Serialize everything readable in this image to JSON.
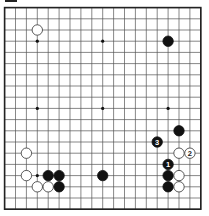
{
  "board": {
    "size": 19,
    "origin_x": 4.6,
    "origin_y": 7.6,
    "step_x": 10.9,
    "step_y": 11.2,
    "line_color": "#555555",
    "border_color": "#222222",
    "star_points": [
      [
        4,
        4
      ],
      [
        10,
        4
      ],
      [
        16,
        4
      ],
      [
        4,
        10
      ],
      [
        10,
        10
      ],
      [
        16,
        10
      ],
      [
        4,
        16
      ],
      [
        10,
        16
      ],
      [
        16,
        16
      ]
    ]
  },
  "stones": [
    {
      "color": "white",
      "col": 4,
      "row": 3,
      "label": ""
    },
    {
      "color": "black",
      "col": 16,
      "row": 4,
      "label": ""
    },
    {
      "color": "black",
      "col": 17,
      "row": 12,
      "label": ""
    },
    {
      "color": "black",
      "col": 15,
      "row": 13,
      "label": "3"
    },
    {
      "color": "white",
      "col": 3,
      "row": 14,
      "label": ""
    },
    {
      "color": "white",
      "col": 17,
      "row": 14,
      "label": ""
    },
    {
      "color": "white",
      "col": 18,
      "row": 14,
      "label": "2"
    },
    {
      "color": "black",
      "col": 16,
      "row": 15,
      "label": "1"
    },
    {
      "color": "white",
      "col": 3,
      "row": 16,
      "label": ""
    },
    {
      "color": "black",
      "col": 5,
      "row": 16,
      "label": ""
    },
    {
      "color": "black",
      "col": 6,
      "row": 16,
      "label": ""
    },
    {
      "color": "black",
      "col": 10,
      "row": 16,
      "label": ""
    },
    {
      "color": "black",
      "col": 16,
      "row": 16,
      "label": ""
    },
    {
      "color": "white",
      "col": 17,
      "row": 16,
      "label": ""
    },
    {
      "color": "white",
      "col": 4,
      "row": 17,
      "label": ""
    },
    {
      "color": "white",
      "col": 5,
      "row": 17,
      "label": ""
    },
    {
      "color": "black",
      "col": 6,
      "row": 17,
      "label": ""
    },
    {
      "color": "black",
      "col": 16,
      "row": 17,
      "label": ""
    },
    {
      "color": "white",
      "col": 17,
      "row": 17,
      "label": ""
    }
  ]
}
